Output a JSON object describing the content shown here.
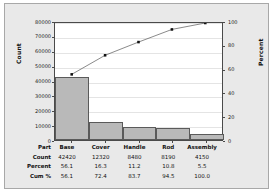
{
  "chart_data": {
    "type": "bar",
    "title": "",
    "categories": [
      "Base",
      "Cover",
      "Handle",
      "Rod",
      "Assembly"
    ],
    "values": [
      42420,
      12320,
      8480,
      8190,
      4150
    ],
    "series": [
      {
        "name": "Count",
        "values": [
          42420,
          12320,
          8480,
          8190,
          4150
        ]
      },
      {
        "name": "Cum %",
        "values": [
          56.1,
          72.4,
          83.7,
          94.5,
          100.0
        ]
      }
    ],
    "percent": [
      56.1,
      16.3,
      11.2,
      10.8,
      5.5
    ],
    "cum_percent": [
      56.1,
      72.4,
      83.7,
      94.5,
      100.0
    ],
    "xlabel": "",
    "ylabel": "Count",
    "y2label": "Percent",
    "ylim": [
      0,
      80000
    ],
    "y2lim": [
      0,
      100
    ],
    "yticks": [
      0,
      10000,
      20000,
      30000,
      40000,
      50000,
      60000,
      70000,
      80000
    ],
    "y2ticks": [
      0,
      20,
      40,
      60,
      80,
      100
    ],
    "grid": true,
    "legend": "none",
    "bar_color": "#b9b9b9",
    "bar_edge_color": "#5a5a5a",
    "line_color": "#555555",
    "marker_color": "#111111",
    "panel_color": "#e9e9e9",
    "plot_bg_color": "#ffffff"
  },
  "axes": {
    "left": {
      "title": "Count",
      "ticks": [
        "80000",
        "70000",
        "60000",
        "50000",
        "40000",
        "30000",
        "20000",
        "10000",
        "0"
      ]
    },
    "right": {
      "title": "Percent",
      "ticks": [
        "100",
        "80",
        "60",
        "40",
        "20",
        "0"
      ]
    }
  },
  "table": {
    "rows": [
      {
        "label": "Part",
        "cells": [
          "Base",
          "Cover",
          "Handle",
          "Rod",
          "Assembly"
        ]
      },
      {
        "label": "Count",
        "cells": [
          "42420",
          "12320",
          "8480",
          "8190",
          "4150"
        ]
      },
      {
        "label": "Percent",
        "cells": [
          "56.1",
          "16.3",
          "11.2",
          "10.8",
          "5.5"
        ]
      },
      {
        "label": "Cum %",
        "cells": [
          "56.1",
          "72.4",
          "83.7",
          "94.5",
          "100.0"
        ]
      }
    ]
  }
}
